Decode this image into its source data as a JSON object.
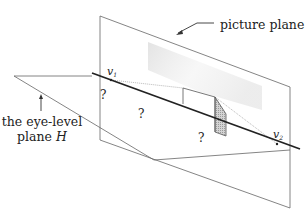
{
  "labels": {
    "picture_plane": "picture plane",
    "eye_level_line1": "the eye-level",
    "eye_level_line2": "plane ",
    "eye_level_symbol": "H",
    "v1_main": "v",
    "v1_sub": "1",
    "v2_main": "v",
    "v2_sub": "2",
    "question_marks": [
      "?",
      "?",
      "?"
    ]
  },
  "colors": {
    "line": "#555555",
    "horizon": "#222222",
    "shade": "#bdbdbd",
    "text": "#222222"
  }
}
